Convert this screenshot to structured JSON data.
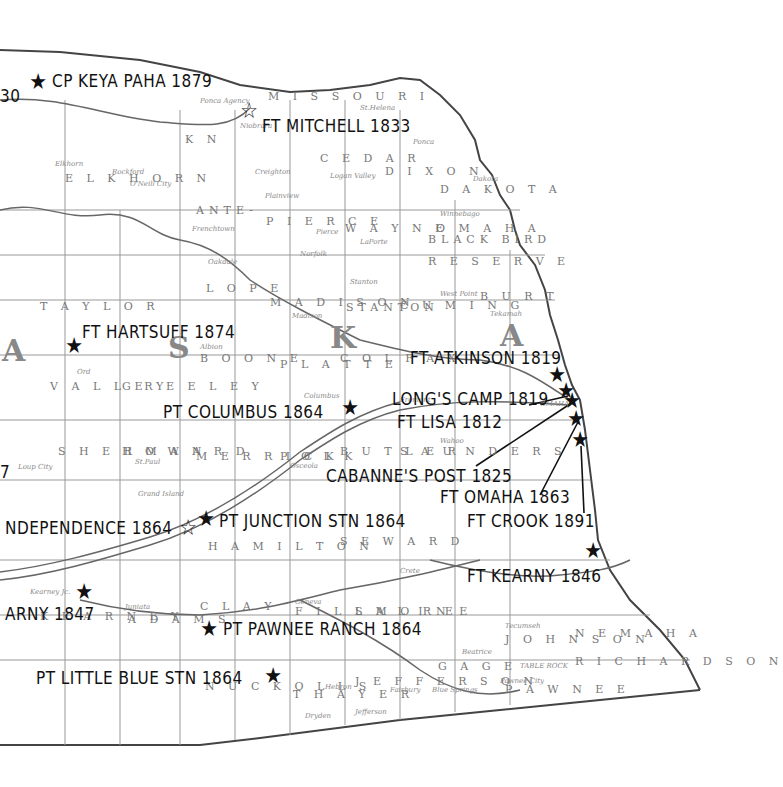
{
  "map": {
    "region": "Nebraska (eastern)",
    "style": "historic engraved county map, black and white",
    "state_letters": [
      "A",
      "S",
      "K",
      "A"
    ],
    "counties": [
      "KNOX",
      "CEDAR",
      "DIXON",
      "DAKOTA",
      "ANTELOPE",
      "PIERCE",
      "WAYNE",
      "OMAHA BLACK BIRD RESERVE",
      "HOLT (ELKHORN)",
      "LOUP",
      "MADISON",
      "STANTON",
      "CUMING",
      "BURT",
      "TAYLOR",
      "BOONE",
      "PLATTE",
      "COLFAX",
      "VALLEY",
      "GREELEY",
      "SHERMAN",
      "HOWARD",
      "MERRICK",
      "POLK",
      "BUTLER",
      "SAUNDERS",
      "HAMILTON",
      "SEWARD",
      "CLAY",
      "ADAMS",
      "KEARNEY",
      "FILLMORE",
      "SALINE",
      "NUCKOLLS",
      "THAYER",
      "JEFFERSON",
      "GAGE",
      "JOHNSON",
      "NEMAHA",
      "RICHARDSON",
      "PAWNEE",
      "OTOE"
    ],
    "river_labels": [
      "MISSOURI",
      "Elkhorn River",
      "RIVER"
    ]
  },
  "sites": [
    {
      "label": "CP KEYA PAHA 1879",
      "marker": "filled-star",
      "x": 38,
      "y": 83
    },
    {
      "label": "FT MITCHELL 1833",
      "marker": "hollow-star",
      "x": 249,
      "y": 112
    },
    {
      "label": "FT HARTSUFF 1874",
      "marker": "filled-star",
      "x": 74,
      "y": 347
    },
    {
      "label": "PT COLUMBUS 1864",
      "marker": "filled-star",
      "x": 350,
      "y": 409
    },
    {
      "label": "FT ATKINSON 1819",
      "marker": "filled-star",
      "x": 557,
      "y": 376
    },
    {
      "label": "LONG'S CAMP 1819",
      "marker": "filled-star",
      "x": 566,
      "y": 392
    },
    {
      "label": "FT LISA 1812",
      "marker": "filled-star",
      "x": 572,
      "y": 402
    },
    {
      "label": "CABANNE'S POST 1825",
      "marker": "filled-star",
      "x": 574,
      "y": 418
    },
    {
      "label": "FT OMAHA 1863",
      "marker": "filled-star",
      "x": 576,
      "y": 420
    },
    {
      "label": "FT CROOK 1891",
      "marker": "filled-star",
      "x": 580,
      "y": 441
    },
    {
      "label": "FT KEARNY 1846",
      "marker": "filled-star",
      "x": 593,
      "y": 552
    },
    {
      "label": "INDEPENDENCE 1864",
      "marker": "hollow-star",
      "x": 188,
      "y": 529
    },
    {
      "label": "PT JUNCTION STN 1864",
      "marker": "filled-star",
      "x": 206,
      "y": 520
    },
    {
      "label": "KEARNY 1847",
      "marker": "filled-star",
      "x": 84,
      "y": 593
    },
    {
      "label": "PT PAWNEE RANCH 1864",
      "marker": "filled-star",
      "x": 209,
      "y": 630
    },
    {
      "label": "PT LITTLE BLUE STN 1864",
      "marker": "filled-star",
      "x": 273,
      "y": 677
    },
    {
      "label": "...30",
      "marker": "none",
      "x": 0,
      "y": 96
    },
    {
      "label": "...7",
      "marker": "none",
      "x": 0,
      "y": 470
    }
  ],
  "labels_display": {
    "keya_paha": "CP KEYA PAHA 1879",
    "mitchell": "FT MITCHELL 1833",
    "hartsuff": "FT HARTSUFF 1874",
    "columbus": "PT COLUMBUS 1864",
    "atkinson": "FT ATKINSON 1819",
    "longs_camp": "LONG'S CAMP 1819",
    "lisa": "FT LISA 1812",
    "cabanne": "CABANNE'S POST 1825",
    "omaha": "FT OMAHA 1863",
    "crook": "FT CROOK 1891",
    "kearny_1846": "FT KEARNY 1846",
    "independence": "NDEPENDENCE 1864",
    "junction": "PT JUNCTION STN 1864",
    "kearny_1847": "ARNY 1847",
    "pawnee": "PT PAWNEE RANCH 1864",
    "little_blue": "PT LITTLE BLUE STN 1864",
    "cut_30": "30",
    "cut_7": "7"
  },
  "county_labels": {
    "knox": "K N",
    "cedar": "C E D A R",
    "dixon": "D I X O N",
    "dakota": "D A K O T A",
    "antelope": "ANTE-",
    "pierce": "P I E R C E",
    "wayne": "W A Y N E",
    "omaha": "O M A H A",
    "blackbird": "BLACK BIRD",
    "reserve": "R E S E R V E",
    "elkhorn": "E L K H O R N",
    "lope": "L O P E",
    "madison": "M A D I S O N",
    "stanton": "STANTON",
    "cuming": "C U M I N G",
    "burt": "B U R T",
    "taylor": "T A Y L O R",
    "boone": "B O O N E",
    "platte": "P L A T T E",
    "colfax": "C O L F A X",
    "valley": "V A L L E Y",
    "greeley": "G R E E L E Y",
    "sherman": "S H E R M A N",
    "howard": "H O W A R D",
    "merrick": "M E R R I C K",
    "polk": "P O L K",
    "butler": "B U T L E R",
    "saunders": "S A U N D E R S",
    "hamilton": "H A M I L T O N",
    "seward": "S E W A R D",
    "clay": "C L A Y",
    "adams": "A D A M S",
    "kearney": "K E A R N E Y",
    "fillmore": "F I L L M O R E",
    "saline": "S A L I N E",
    "nuckolls": "N U C K O L L S",
    "thayer": "T H A Y E R",
    "jefferson": "J E F F E R S O N",
    "gage": "G A G E",
    "johnson": "J O H N S O N",
    "nemaha": "N E M A H A",
    "richardson": "R I C H A R D S O N",
    "pawnee": "P A W N E E",
    "missouri": "M I S S O U R I"
  },
  "town_labels": {
    "ponca_agency": "Ponca Agency",
    "niobrara": "Niobrara",
    "creighton": "Creighton",
    "st_helena": "St.Helena",
    "ponca": "Ponca",
    "dakota": "Dakota",
    "winnebago": "Winnebago",
    "norfolk": "Norfolk",
    "oakdale": "Oakdale",
    "albion": "Albion",
    "ord": "Ord",
    "columbus": "Columbus",
    "osceola": "Osceola",
    "beatrice": "Beatrice",
    "tecumseh": "Tecumseh",
    "fairbury": "Fairbury",
    "hebron": "Hebron",
    "table_rock": "TABLE ROCK",
    "pawnee_city": "Pawnee City",
    "loup_city": "Loup City",
    "st_paul": "St.Paul",
    "grand_island": "Grand Island",
    "kearney": "Kearney Jc.",
    "juniata": "Juniata",
    "crete": "Crete",
    "blair": "Blair",
    "omaha": "OMAHA",
    "elkhorn": "Elkhorn",
    "oneill": "O'Neill City",
    "rockford": "Rockford",
    "tekamah": "Tekamah",
    "west_point": "West Point",
    "wahoo": "Wahoo",
    "geneva": "Geneva",
    "hastings": "Hastings",
    "fremont": "Fremont",
    "stanton": "Stanton",
    "madison": "Madison",
    "pierce": "Pierce",
    "plainview": "Plainview",
    "laporte": "LaPorte",
    "logan_valley": "Logan Valley",
    "frenchtown": "Frenchtown",
    "dryden": "Dryden",
    "jefferson": "Jefferson",
    "blue_springs": "Blue Springs"
  }
}
